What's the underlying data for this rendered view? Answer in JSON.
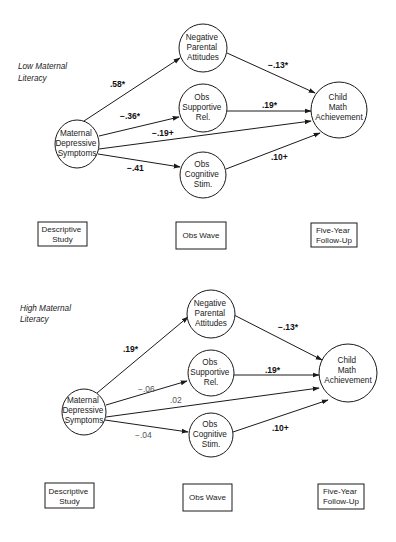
{
  "panels": [
    {
      "label_lines": [
        "Low Maternal",
        "Literacy"
      ],
      "nodes": {
        "maternal": {
          "lines": [
            "Maternal",
            "Depressive",
            "Symptoms"
          ]
        },
        "negative": {
          "lines": [
            "Negative",
            "Parental",
            "Attitudes"
          ]
        },
        "supportive": {
          "lines": [
            "Obs",
            "Supportive",
            "Rel."
          ]
        },
        "cognitive": {
          "lines": [
            "Obs",
            "Cognitive",
            "Stim."
          ]
        },
        "child": {
          "lines": [
            "Child",
            "Math",
            "Achievement"
          ]
        }
      },
      "edges": {
        "maternal_negative": ".58*",
        "maternal_supportive": "−.36*",
        "maternal_child": "−.19+",
        "maternal_cognitive": "−.41",
        "negative_child": "−.13*",
        "supportive_child": ".19*",
        "cognitive_child": ".10+"
      },
      "waves": [
        {
          "lines": [
            "Descriptive",
            "Study"
          ]
        },
        {
          "lines": [
            "Obs Wave"
          ]
        },
        {
          "lines": [
            "Five-Year",
            "Follow-Up"
          ]
        }
      ]
    },
    {
      "label_lines": [
        "High Maternal",
        "Literacy"
      ],
      "nodes": {
        "maternal": {
          "lines": [
            "Maternal",
            "Depressive",
            "Symptoms"
          ]
        },
        "negative": {
          "lines": [
            "Negative",
            "Parental",
            "Attitudes"
          ]
        },
        "supportive": {
          "lines": [
            "Obs",
            "Supportive",
            "Rel."
          ]
        },
        "cognitive": {
          "lines": [
            "Obs",
            "Cognitive",
            "Stim."
          ]
        },
        "child": {
          "lines": [
            "Child",
            "Math",
            "Achievement"
          ]
        }
      },
      "edges": {
        "maternal_negative": ".19*",
        "maternal_supportive": "−.06",
        "maternal_child": ".02",
        "maternal_cognitive": "−.04",
        "negative_child": "−.13*",
        "supportive_child": ".19*",
        "cognitive_child": ".10+"
      },
      "waves": [
        {
          "lines": [
            "Descriptive",
            "Study"
          ]
        },
        {
          "lines": [
            "Obs Wave"
          ]
        },
        {
          "lines": [
            "Five-Year",
            "Follow-Up"
          ]
        }
      ]
    }
  ]
}
